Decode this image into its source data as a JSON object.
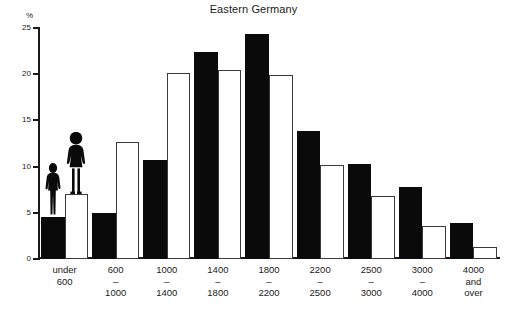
{
  "chart_data": {
    "type": "bar",
    "title": "Eastern Germany",
    "xlabel": "",
    "ylabel": "%",
    "ylim": [
      0,
      25
    ],
    "yticks": [
      0,
      5,
      10,
      15,
      20,
      25
    ],
    "ytick_labels": [
      "0",
      "5",
      "10",
      "15",
      "20",
      "25"
    ],
    "grid": false,
    "legend_position": "none",
    "categories": [
      "under 600",
      "600 – 1000",
      "1000 – 1400",
      "1400 – 1800",
      "1800 – 2200",
      "2200 – 2500",
      "2500 – 3000",
      "3000 – 4000",
      "4000 and over"
    ],
    "category_lines": [
      [
        "under",
        "600"
      ],
      [
        "600",
        "–",
        "1000"
      ],
      [
        "1000",
        "–",
        "1400"
      ],
      [
        "1400",
        "–",
        "1800"
      ],
      [
        "1800",
        "–",
        "2200"
      ],
      [
        "2200",
        "–",
        "2500"
      ],
      [
        "2500",
        "–",
        "3000"
      ],
      [
        "3000",
        "–",
        "4000"
      ],
      [
        "4000",
        "and",
        "over"
      ]
    ],
    "series": [
      {
        "name": "men",
        "style": "solid-black",
        "values": [
          4.6,
          5.0,
          10.7,
          22.4,
          24.3,
          13.9,
          10.3,
          7.8,
          3.9
        ]
      },
      {
        "name": "women",
        "style": "hollow-white",
        "values": [
          7.0,
          12.7,
          20.1,
          20.5,
          19.9,
          10.2,
          6.8,
          3.6,
          1.3
        ]
      }
    ],
    "annotations": [
      {
        "name": "male-silhouette",
        "over_bar": "under 600 / men"
      },
      {
        "name": "female-silhouette",
        "over_bar": "under 600 / women"
      }
    ]
  },
  "colors": {
    "solid_bar": "#0a0a0a",
    "hollow_bar_border": "#3a3a3a",
    "hollow_bar_fill": "#ffffff",
    "axis": "#1a1a1a",
    "background": "#ffffff"
  }
}
